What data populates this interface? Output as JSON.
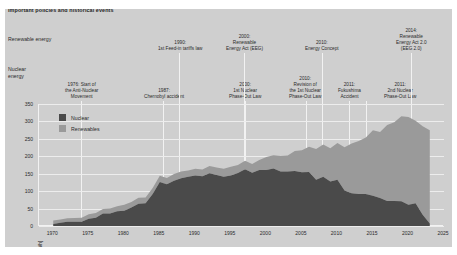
{
  "header": {
    "title": "Important policies and historical events",
    "row_renewable": "Renewable energy",
    "row_nuclear_line1": "Nuclear",
    "row_nuclear_line2": "energy"
  },
  "annotations": {
    "renewable": [
      {
        "name": "feed-in-tariffs-1990",
        "year": "1990:",
        "text": "1st Feed-in tariffs law",
        "x": 180,
        "connector_x": 179
      },
      {
        "name": "eeg-2000",
        "year": "2000:",
        "text": "Renewable\nEnergy Act (EEG)",
        "x": 244,
        "connector_x": 244
      },
      {
        "name": "energy-concept-2010",
        "year": "2010:",
        "text": "Energy Concept",
        "x": 322,
        "connector_x": 322
      },
      {
        "name": "eeg-2-2014",
        "year": "2014:",
        "text": "Renewable\nEnergy Act 2.0\n(EEG 2.0)",
        "x": 411,
        "connector_x": 411
      }
    ],
    "nuclear": [
      {
        "name": "anti-nuclear-movement-1976",
        "year": "1976: Start of",
        "text": "the Anti-Nuclear\nMovement",
        "x": 81,
        "connector_x": 81
      },
      {
        "name": "chernobyl-1987",
        "year": "1987:",
        "text": "Chernobyl accident",
        "x": 164,
        "connector_x": 163
      },
      {
        "name": "phase-out-law-1-2000",
        "year": "2000:",
        "text": "1st Nuclear\nPhase-Out Law",
        "x": 245,
        "connector_x": 245
      },
      {
        "name": "phase-out-revision-2010",
        "year": "2010:",
        "text": "Revision of\nthe 1st Nuclear\nPhase-Out Law",
        "x": 305,
        "connector_x": 306
      },
      {
        "name": "fukushima-2011",
        "year": "2011:",
        "text": "Fukushima\nAccident",
        "x": 349,
        "connector_x": 349
      },
      {
        "name": "phase-out-law-2-2011",
        "year": "2011:",
        "text": "2nd Nuclear\nPhase-Out Law",
        "x": 400,
        "connector_x": 366
      }
    ]
  },
  "legend": {
    "items": [
      {
        "label": "Nuclear",
        "color": "#4a4a4a"
      },
      {
        "label": "Renewables",
        "color": "#9a9a9a"
      }
    ]
  },
  "chart_data": {
    "type": "area",
    "stacked": true,
    "title": "",
    "xlabel": "",
    "ylabel": "[TWh]",
    "ylim": [
      0,
      350
    ],
    "xlim": [
      1968,
      2025
    ],
    "yticks": [
      "0",
      "50",
      "100",
      "150",
      "200",
      "250",
      "300",
      "350"
    ],
    "ytick_values": [
      0,
      50,
      100,
      150,
      200,
      250,
      300,
      350
    ],
    "xticks": [
      "1970",
      "1975",
      "1980",
      "1985",
      "1990",
      "1995",
      "2000",
      "2005",
      "2010",
      "2015",
      "2020",
      "2025"
    ],
    "xtick_values": [
      1970,
      1975,
      1980,
      1985,
      1990,
      1995,
      2000,
      2005,
      2010,
      2015,
      2020,
      2025
    ],
    "grid": true,
    "legend_position": "top-left",
    "x": [
      1970,
      1971,
      1972,
      1973,
      1974,
      1975,
      1976,
      1977,
      1978,
      1979,
      1980,
      1981,
      1982,
      1983,
      1984,
      1985,
      1986,
      1987,
      1988,
      1989,
      1990,
      1991,
      1992,
      1993,
      1994,
      1995,
      1996,
      1997,
      1998,
      1999,
      2000,
      2001,
      2002,
      2003,
      2004,
      2005,
      2006,
      2007,
      2008,
      2009,
      2010,
      2011,
      2012,
      2013,
      2014,
      2015,
      2016,
      2017,
      2018,
      2019,
      2020,
      2021,
      2022,
      2023
    ],
    "series": [
      {
        "name": "Nuclear",
        "color": "#4a4a4a",
        "values": [
          6,
          9,
          12,
          12,
          12,
          21,
          24,
          36,
          36,
          42,
          44,
          53,
          64,
          65,
          92,
          126,
          120,
          130,
          137,
          141,
          145,
          143,
          151,
          146,
          141,
          145,
          152,
          163,
          153,
          161,
          161,
          165,
          156,
          156,
          158,
          154,
          155,
          133,
          141,
          128,
          133,
          102,
          94,
          92,
          92,
          87,
          80,
          72,
          72,
          71,
          61,
          65,
          32,
          7
        ]
      },
      {
        "name": "Renewables",
        "color": "#9a9a9a",
        "values": [
          10,
          10,
          10,
          11,
          12,
          13,
          13,
          13,
          14,
          15,
          17,
          16,
          17,
          17,
          17,
          18,
          18,
          19,
          19,
          18,
          19,
          19,
          21,
          22,
          23,
          25,
          23,
          24,
          25,
          28,
          37,
          38,
          45,
          46,
          57,
          63,
          72,
          88,
          93,
          95,
          105,
          124,
          143,
          152,
          162,
          188,
          190,
          218,
          226,
          244,
          252,
          237,
          254,
          268
        ]
      }
    ],
    "annotations_note": "stacked areas: Nuclear bottom, Renewables on top"
  }
}
